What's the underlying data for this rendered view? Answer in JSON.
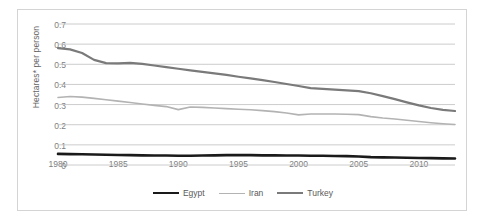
{
  "chart_data": {
    "type": "line",
    "title": "",
    "xlabel": "",
    "ylabel": "Hectares* per person",
    "xlim": [
      1980,
      2013
    ],
    "ylim": [
      0,
      0.7
    ],
    "ytick_labels": [
      "0.7",
      "0.6",
      "0.5",
      "0.4",
      "0.3",
      "0.2",
      "0.1",
      "0"
    ],
    "ytick_values": [
      0.7,
      0.6,
      0.5,
      0.4,
      0.3,
      0.2,
      0.1,
      0
    ],
    "xtick_labels": [
      "1980",
      "1985",
      "1990",
      "1995",
      "2000",
      "2005",
      "2010"
    ],
    "xtick_values": [
      1980,
      1985,
      1990,
      1995,
      2000,
      2005,
      2010
    ],
    "grid": true,
    "legend_position": "bottom",
    "x": [
      1980,
      1981,
      1982,
      1983,
      1984,
      1985,
      1986,
      1987,
      1988,
      1989,
      1990,
      1991,
      1992,
      1993,
      1994,
      1995,
      1996,
      1997,
      1998,
      1999,
      2000,
      2001,
      2002,
      2003,
      2004,
      2005,
      2006,
      2007,
      2008,
      2009,
      2010,
      2011,
      2012,
      2013
    ],
    "series": [
      {
        "name": "Egypt",
        "color": "#1a1a1a",
        "width": 2.6,
        "values": [
          0.055,
          0.054,
          0.053,
          0.052,
          0.051,
          0.05,
          0.049,
          0.048,
          0.047,
          0.047,
          0.046,
          0.046,
          0.047,
          0.048,
          0.049,
          0.049,
          0.049,
          0.048,
          0.048,
          0.047,
          0.047,
          0.046,
          0.046,
          0.045,
          0.044,
          0.042,
          0.039,
          0.038,
          0.037,
          0.036,
          0.035,
          0.034,
          0.033,
          0.032
        ]
      },
      {
        "name": "Iran",
        "color": "#b3b3b3",
        "width": 1.6,
        "values": [
          0.335,
          0.34,
          0.337,
          0.331,
          0.324,
          0.317,
          0.31,
          0.303,
          0.296,
          0.29,
          0.275,
          0.288,
          0.286,
          0.283,
          0.28,
          0.277,
          0.274,
          0.27,
          0.265,
          0.258,
          0.249,
          0.253,
          0.253,
          0.253,
          0.252,
          0.25,
          0.24,
          0.233,
          0.228,
          0.222,
          0.216,
          0.21,
          0.205,
          0.201
        ]
      },
      {
        "name": "Turkey",
        "color": "#7a7a7a",
        "width": 2.2,
        "values": [
          0.58,
          0.574,
          0.556,
          0.522,
          0.506,
          0.505,
          0.507,
          0.502,
          0.494,
          0.486,
          0.478,
          0.47,
          0.462,
          0.455,
          0.447,
          0.438,
          0.43,
          0.421,
          0.412,
          0.402,
          0.392,
          0.382,
          0.378,
          0.374,
          0.37,
          0.367,
          0.356,
          0.342,
          0.327,
          0.311,
          0.296,
          0.283,
          0.274,
          0.268
        ]
      }
    ]
  }
}
